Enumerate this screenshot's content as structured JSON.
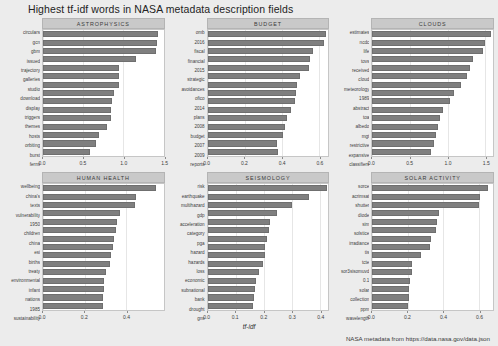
{
  "chart_data": {
    "type": "bar",
    "orientation": "horizontal",
    "title": "Highest tf-idf words in NASA metadata description fields",
    "xlabel": "tf-idf",
    "ylabel": "",
    "caption": "NASA metadata from https://data.nasa.gov/data.json",
    "grid": true,
    "legend": "none",
    "bar_color": "#7f7f7f",
    "strip_color": "#c9c9c9",
    "panel_background": "#ffffff",
    "figure_background": "#ececec",
    "facets": [
      {
        "name": "ASTROPHYSICS",
        "xlim": [
          0,
          1.5
        ],
        "ticks": [
          0.0,
          0.5,
          1.0,
          1.5
        ],
        "tick_labels": [
          "0.0",
          "0.5",
          "1.0",
          "1.5"
        ],
        "categories": [
          "circulars",
          "gcn",
          "gbm",
          "issued",
          "trajectory",
          "galleries",
          "studio",
          "download",
          "display",
          "triggers",
          "themes",
          "hosts",
          "orbiting",
          "burst",
          "fermi"
        ],
        "values": [
          1.43,
          1.42,
          1.4,
          1.15,
          0.95,
          0.94,
          0.94,
          0.88,
          0.86,
          0.85,
          0.84,
          0.8,
          0.7,
          0.66,
          0.58
        ]
      },
      {
        "name": "BUDGET",
        "xlim": [
          0,
          0.65
        ],
        "ticks": [
          0.0,
          0.2,
          0.4,
          0.6
        ],
        "tick_labels": [
          "0.0",
          "0.2",
          "0.4",
          "0.6"
        ],
        "categories": [
          "omb",
          "2016",
          "fiscal",
          "financial",
          "2015",
          "strategic",
          "avoidances",
          "ofico",
          "2014",
          "plans",
          "2008",
          "budget",
          "2007",
          "2009",
          "reports"
        ],
        "values": [
          0.635,
          0.625,
          0.565,
          0.55,
          0.545,
          0.5,
          0.48,
          0.475,
          0.47,
          0.45,
          0.43,
          0.415,
          0.405,
          0.375,
          0.38
        ]
      },
      {
        "name": "CLOUDS",
        "xlim": [
          0,
          1.6
        ],
        "ticks": [
          0.0,
          0.5,
          1.0,
          1.5
        ],
        "tick_labels": [
          "0.0",
          "0.5",
          "1.0",
          "1.5"
        ],
        "categories": [
          "estimates",
          "ncdc",
          "life",
          "tovs",
          "received",
          "cloud",
          "meteorology",
          "1989",
          "abstract",
          "toa",
          "albedo",
          "mgt",
          "restrictive",
          "expansive",
          "classifiers"
        ],
        "values": [
          1.57,
          1.5,
          1.47,
          1.33,
          1.3,
          1.25,
          1.17,
          1.08,
          1.03,
          0.94,
          0.9,
          0.87,
          0.84,
          0.82,
          0.78
        ]
      },
      {
        "name": "HUMAN HEALTH",
        "xlim": [
          0,
          0.58
        ],
        "ticks": [
          0.0,
          0.2,
          0.4
        ],
        "tick_labels": [
          "0.0",
          "0.2",
          "0.4"
        ],
        "categories": [
          "wellbeing",
          "china's",
          "texts",
          "vulnerability",
          "1950",
          "children",
          "china",
          "esi",
          "births",
          "treaty",
          "environmental",
          "infant",
          "nations",
          "1985",
          "sustainability"
        ],
        "values": [
          0.545,
          0.445,
          0.44,
          0.37,
          0.355,
          0.352,
          0.34,
          0.338,
          0.325,
          0.32,
          0.305,
          0.295,
          0.293,
          0.29,
          0.288
        ]
      },
      {
        "name": "SEISMOLOGY",
        "xlim": [
          0,
          0.43
        ],
        "ticks": [
          0.0,
          0.1,
          0.2,
          0.3,
          0.4
        ],
        "tick_labels": [
          "0.0",
          "0.1",
          "0.2",
          "0.3",
          "0.4"
        ],
        "categories": [
          "risk",
          "earthquake",
          "multihazard",
          "gdp",
          "acceleration",
          "category",
          "pga",
          "hazard",
          "hazards",
          "loss",
          "economic",
          "subnational",
          "bank",
          "drought",
          "gns"
        ],
        "values": [
          0.425,
          0.36,
          0.3,
          0.248,
          0.222,
          0.22,
          0.212,
          0.205,
          0.203,
          0.198,
          0.182,
          0.172,
          0.17,
          0.165,
          0.16
        ]
      },
      {
        "name": "SOLAR ACTIVITY",
        "xlim": [
          0,
          0.68
        ],
        "ticks": [
          0.0,
          0.2,
          0.4,
          0.6
        ],
        "tick_labels": [
          "0.0",
          "0.2",
          "0.4",
          "0.6"
        ],
        "categories": [
          "sorce",
          "acrimsat",
          "shutter",
          "diode",
          "sim",
          "solstice",
          "irradiance",
          "tis",
          "tcte",
          "sor3sisomuvd",
          "0.1",
          "solar",
          "collection",
          "ppm",
          "wavelength"
        ],
        "values": [
          0.65,
          0.605,
          0.6,
          0.375,
          0.362,
          0.358,
          0.33,
          0.325,
          0.272,
          0.225,
          0.222,
          0.215,
          0.208,
          0.205,
          0.2
        ]
      }
    ]
  }
}
